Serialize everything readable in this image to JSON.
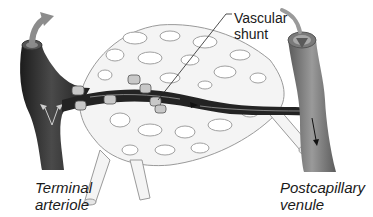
{
  "figure": {
    "labels": {
      "terminal_arteriole": "Terminal\narteriole",
      "postcapillary_venule": "Postcapillary\nvenule",
      "vascular_shunt": "Vascular\nshunt"
    },
    "components": [
      {
        "name": "terminal-arteriole",
        "description": "dark vessel on left, blood flows in"
      },
      {
        "name": "postcapillary-venule",
        "description": "lighter gray vessel on right, blood flows out downward"
      },
      {
        "name": "vascular-shunt",
        "description": "dark channel connecting arteriole to venule"
      },
      {
        "name": "capillary-network",
        "description": "pale mesh of true capillaries"
      },
      {
        "name": "precapillary-sphincters",
        "description": "small cuff-like rings at capillary origins"
      }
    ],
    "colors": {
      "arteriole": "#2a2a2a",
      "venule": "#6e6e6e",
      "capillary_fill": "#f4f4f4",
      "capillary_stroke": "#9a9a9a",
      "arrow_gray": "#8c8c8c",
      "text": "#1a1a1a"
    }
  }
}
